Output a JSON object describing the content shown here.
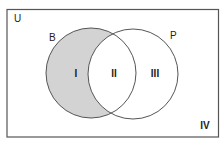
{
  "diagram": {
    "type": "venn",
    "universe_label": "U",
    "sets": [
      {
        "label": "B",
        "shaded": "B only (region I)"
      },
      {
        "label": "P"
      }
    ],
    "regions": [
      {
        "label": "I",
        "description": "B only",
        "shaded": true
      },
      {
        "label": "II",
        "description": "B and P"
      },
      {
        "label": "III",
        "description": "P only"
      },
      {
        "label": "IV",
        "description": "outside B and P"
      }
    ],
    "colors": {
      "shade": "#d3d3d3",
      "stroke": "#555555",
      "background": "#ffffff"
    }
  }
}
